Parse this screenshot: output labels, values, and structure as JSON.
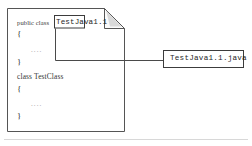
{
  "figure": {
    "kind": "source-file-naming-diagram",
    "stroke_color": "#4a4a4a",
    "text_color": "#2a2a2a",
    "faint_color": "#9a9a9a",
    "background": "#ffffff"
  },
  "document_page": {
    "name": "java-source-page",
    "corner_fold": "top-right",
    "code_lines": [
      {
        "id": "line-1-declaration",
        "keyword": "public class",
        "boxed_name": "TestJava1.1"
      },
      {
        "id": "line-2-open-brace",
        "text": "{"
      },
      {
        "id": "line-3-body",
        "text": "...."
      },
      {
        "id": "line-4-close-brace",
        "text": "}"
      },
      {
        "id": "line-5-declaration",
        "text": "class TestClass"
      },
      {
        "id": "line-6-open-brace",
        "text": "{"
      },
      {
        "id": "line-7-body",
        "text": "...."
      },
      {
        "id": "line-8-close-brace",
        "text": "}"
      }
    ]
  },
  "highlight_box": {
    "name": "class-name-highlight",
    "value": "TestJava1.1"
  },
  "callout": {
    "name": "file-name-callout",
    "value": "TestJava1.1.java",
    "connector": "elbow-from-highlight-box-to-callout"
  }
}
